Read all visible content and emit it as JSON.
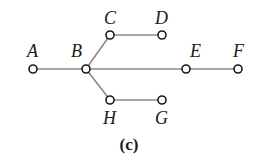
{
  "diagram": {
    "type": "tree-graph",
    "caption": "(c)",
    "nodes": [
      {
        "id": "A",
        "label": "A",
        "x": 33,
        "y": 69,
        "label_x": 27,
        "label_y": 57
      },
      {
        "id": "B",
        "label": "B",
        "x": 86,
        "y": 69,
        "label_x": 71,
        "label_y": 57
      },
      {
        "id": "C",
        "label": "C",
        "x": 110,
        "y": 35,
        "label_x": 104,
        "label_y": 24
      },
      {
        "id": "D",
        "label": "D",
        "x": 162,
        "y": 35,
        "label_x": 155,
        "label_y": 24
      },
      {
        "id": "E",
        "label": "E",
        "x": 186,
        "y": 69,
        "label_x": 190,
        "label_y": 57
      },
      {
        "id": "F",
        "label": "F",
        "x": 238,
        "y": 69,
        "label_x": 233,
        "label_y": 57
      },
      {
        "id": "H",
        "label": "H",
        "x": 110,
        "y": 100,
        "label_x": 103,
        "label_y": 124
      },
      {
        "id": "G",
        "label": "G",
        "x": 162,
        "y": 100,
        "label_x": 155,
        "label_y": 124
      }
    ],
    "edges": [
      {
        "from": "A",
        "to": "B"
      },
      {
        "from": "B",
        "to": "C"
      },
      {
        "from": "C",
        "to": "D"
      },
      {
        "from": "B",
        "to": "E"
      },
      {
        "from": "E",
        "to": "F"
      },
      {
        "from": "B",
        "to": "H"
      },
      {
        "from": "H",
        "to": "G"
      }
    ],
    "colors": {
      "edge": "#8a8a8a",
      "node_stroke": "#1a1a1a",
      "node_fill": "#ffffff",
      "text": "#1a1a1a"
    }
  }
}
